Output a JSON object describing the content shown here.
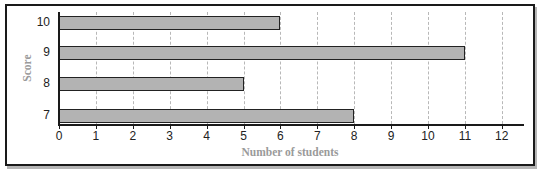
{
  "chart_data": {
    "type": "bar",
    "orientation": "horizontal",
    "title": "",
    "xlabel": "Number of students",
    "ylabel": "Score",
    "categories": [
      "10",
      "9",
      "8",
      "7"
    ],
    "values": [
      6,
      11,
      5,
      8
    ],
    "xlim": [
      0,
      12.7
    ],
    "xticks": [
      0,
      1,
      2,
      3,
      4,
      5,
      6,
      7,
      8,
      9,
      10,
      11,
      12
    ],
    "grid": "vertical dashed",
    "legend": null,
    "colors": {
      "bar_fill": "#b3b3b3",
      "bar_edge": "#222222",
      "axis_title": "#9a9a9a"
    }
  },
  "labels": {
    "xtitle": "Number of students",
    "ytitle": "Score",
    "xticks": [
      "0",
      "1",
      "2",
      "3",
      "4",
      "5",
      "6",
      "7",
      "8",
      "9",
      "10",
      "11",
      "12"
    ],
    "yticks": [
      "10",
      "9",
      "8",
      "7"
    ]
  }
}
